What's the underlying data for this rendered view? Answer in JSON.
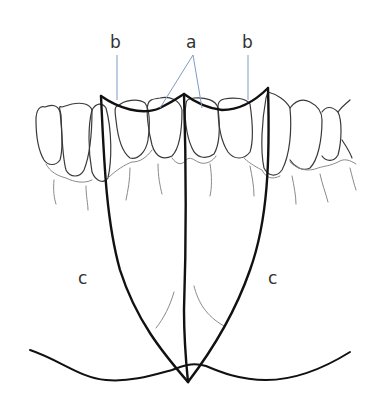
{
  "figure": {
    "type": "dental anatomical line drawing",
    "labels": {
      "a": "a",
      "b_left": "b",
      "b_right": "b",
      "c_left": "c",
      "c_right": "c"
    },
    "colors": {
      "bold_line": "#111111",
      "tooth_outline": "#3a3a3a",
      "faint_line": "#8a8a8a",
      "leader_line": "#7f9bc4",
      "background": "#ffffff"
    }
  }
}
